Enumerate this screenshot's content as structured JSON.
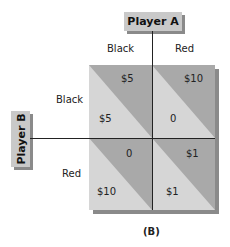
{
  "player_a": "Player A",
  "player_b": "Player B",
  "columns": [
    "Black",
    "Red"
  ],
  "rows": [
    "Black",
    "Red"
  ],
  "payoffs": [
    [
      {
        "a": "$5",
        "b": "$5"
      },
      {
        "a": "$10",
        "b": "0"
      }
    ],
    [
      {
        "a": "0",
        "b": "$10"
      },
      {
        "a": "$1",
        "b": "$1"
      }
    ]
  ],
  "caption": "(B)",
  "colors": {
    "dark": "#a9a9a9",
    "light": "#d6d6d6",
    "shadow": "#8a8a8a",
    "label_bg": "#c9c9c9"
  }
}
